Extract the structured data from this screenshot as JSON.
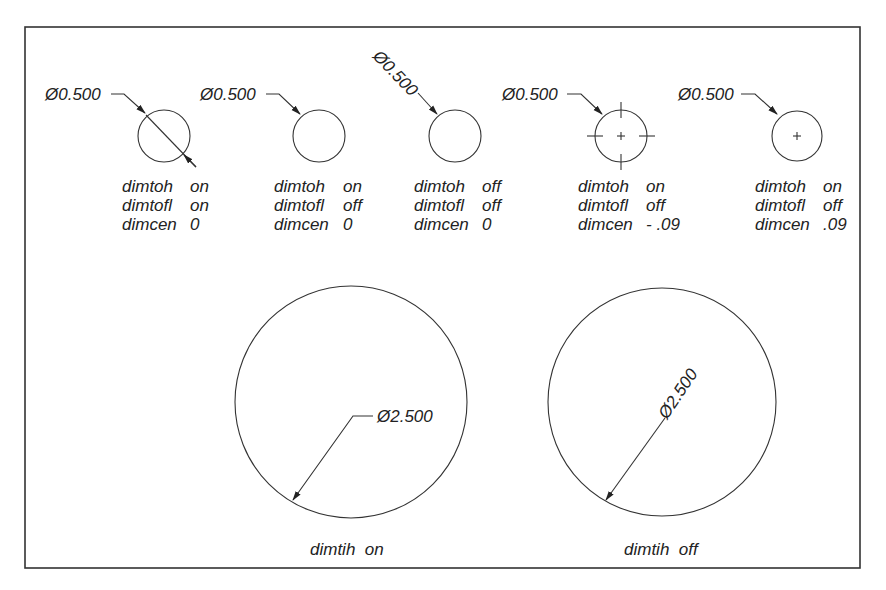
{
  "diagram": {
    "small_examples": [
      {
        "dim_text": "Ø0.500",
        "settings": [
          {
            "name": "dimtoh",
            "value": "on"
          },
          {
            "name": "dimtofl",
            "value": "on"
          },
          {
            "name": "dimcen",
            "value": "0"
          }
        ]
      },
      {
        "dim_text": "Ø0.500",
        "settings": [
          {
            "name": "dimtoh",
            "value": "on"
          },
          {
            "name": "dimtofl",
            "value": "off"
          },
          {
            "name": "dimcen",
            "value": "0"
          }
        ]
      },
      {
        "dim_text": "Ø0.500",
        "settings": [
          {
            "name": "dimtoh",
            "value": "off"
          },
          {
            "name": "dimtofl",
            "value": "off"
          },
          {
            "name": "dimcen",
            "value": "0"
          }
        ]
      },
      {
        "dim_text": "Ø0.500",
        "settings": [
          {
            "name": "dimtoh",
            "value": "on"
          },
          {
            "name": "dimtofl",
            "value": "off"
          },
          {
            "name": "dimcen",
            "value": "- .09"
          }
        ]
      },
      {
        "dim_text": "Ø0.500",
        "settings": [
          {
            "name": "dimtoh",
            "value": "on"
          },
          {
            "name": "dimtofl",
            "value": "off"
          },
          {
            "name": "dimcen",
            "value": ".09"
          }
        ]
      }
    ],
    "large_examples": [
      {
        "dim_text": "Ø2.500",
        "caption": "dimtih  on"
      },
      {
        "dim_text": "Ø2.500",
        "caption": "dimtih  off"
      }
    ],
    "colors": {
      "line": "#333333",
      "text": "#222222",
      "background": "#ffffff"
    }
  }
}
